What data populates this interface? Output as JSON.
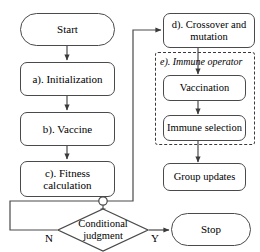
{
  "diagram": {
    "stroke_color": "#4a4a4a",
    "dashed_color": "#3a3a3a",
    "text_color": "#000000",
    "background": "#ffffff"
  },
  "nodes": {
    "start": {
      "label": "Start",
      "shape": "pill"
    },
    "initialization": {
      "label": "a). Initialization",
      "shape": "rounded-rect"
    },
    "vaccine": {
      "label": "b). Vaccine",
      "shape": "rounded-rect"
    },
    "fitness": {
      "label": "c). Fitness\ncalculation",
      "shape": "rounded-rect"
    },
    "conditional": {
      "label": "Conditional\njudgment",
      "shape": "diamond"
    },
    "crossover": {
      "label": "d). Crossover and\nmutation",
      "shape": "rounded-rect"
    },
    "vaccination": {
      "label": "Vaccination",
      "shape": "rounded-rect"
    },
    "immune_selection": {
      "label": "Immune selection",
      "shape": "rounded-rect"
    },
    "group_updates": {
      "label": "Group updates",
      "shape": "rounded-rect"
    },
    "stop": {
      "label": "Stop",
      "shape": "pill"
    }
  },
  "groups": {
    "immune_operator": {
      "caption": "e). Immune operator"
    }
  },
  "edge_labels": {
    "no_branch": "N",
    "yes_branch": "Y"
  }
}
